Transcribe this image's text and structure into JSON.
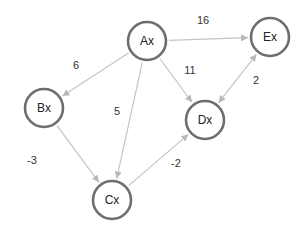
{
  "diagram": {
    "type": "directed-weighted-graph",
    "colors": {
      "node_stroke": "#6e6e6e",
      "node_fill": "#ffffff",
      "edge": "#c4c4c4",
      "arrowhead": "#b8b8b8",
      "text": "#222222"
    },
    "nodes": [
      {
        "id": "Ax",
        "label": "Ax",
        "x": 147,
        "y": 41
      },
      {
        "id": "Bx",
        "label": "Bx",
        "x": 44,
        "y": 108
      },
      {
        "id": "Cx",
        "label": "Cx",
        "x": 112,
        "y": 200
      },
      {
        "id": "Dx",
        "label": "Dx",
        "x": 205,
        "y": 120
      },
      {
        "id": "Ex",
        "label": "Ex",
        "x": 270,
        "y": 37
      }
    ],
    "edges": [
      {
        "from": "Ax",
        "to": "Ex",
        "weight": "16",
        "bidirectional": false,
        "label_x": 203,
        "label_y": 20
      },
      {
        "from": "Ax",
        "to": "Bx",
        "weight": "6",
        "bidirectional": false,
        "label_x": 76,
        "label_y": 65
      },
      {
        "from": "Ax",
        "to": "Dx",
        "weight": "11",
        "bidirectional": false,
        "label_x": 190,
        "label_y": 70
      },
      {
        "from": "Ax",
        "to": "Cx",
        "weight": "5",
        "bidirectional": false,
        "label_x": 117,
        "label_y": 111
      },
      {
        "from": "Ex",
        "to": "Dx",
        "weight": "2",
        "bidirectional": true,
        "label_x": 256,
        "label_y": 80
      },
      {
        "from": "Bx",
        "to": "Cx",
        "weight": "-3",
        "bidirectional": false,
        "label_x": 32,
        "label_y": 160
      },
      {
        "from": "Cx",
        "to": "Dx",
        "weight": "-2",
        "bidirectional": false,
        "label_x": 176,
        "label_y": 163
      }
    ]
  }
}
